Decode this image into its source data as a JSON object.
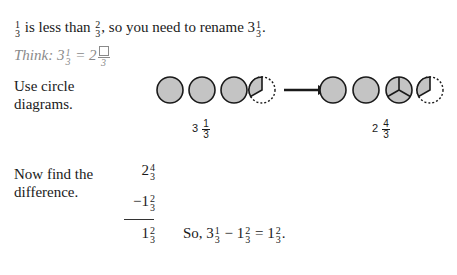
{
  "intro": {
    "lead_frac": {
      "num": "1",
      "den": "3"
    },
    "text_a": " is less than ",
    "mid_frac": {
      "num": "2",
      "den": "3"
    },
    "text_b": ", so you need to rename 3",
    "end_frac": {
      "num": "1",
      "den": "3"
    },
    "text_c": "."
  },
  "think": {
    "label": "Think: 3",
    "frac1": {
      "num": "1",
      "den": "3"
    },
    "eq": " = 2",
    "frac2": {
      "num": "□",
      "den": "3"
    }
  },
  "circles_section": {
    "instruction_line1": "Use circle",
    "instruction_line2": "diagrams.",
    "left_label": {
      "whole": "3",
      "num": "1",
      "den": "3"
    },
    "right_label": {
      "whole": "2",
      "num": "4",
      "den": "3"
    },
    "left_diagram": [
      "full-circle",
      "full-circle",
      "full-circle",
      "one-third-circle"
    ],
    "right_diagram": [
      "full-circle",
      "full-circle",
      "circle-split-thirds",
      "one-third-circle"
    ],
    "arrow": "right-arrow",
    "fill_color": "#c4c4c4",
    "stroke_color": "#1a1a1a"
  },
  "difference": {
    "instruction_line1": "Now find the",
    "instruction_line2": "difference.",
    "minuend": {
      "whole": "2",
      "num": "4",
      "den": "3"
    },
    "operator": "−",
    "subtrahend": {
      "whole": "1",
      "num": "2",
      "den": "3"
    },
    "result": {
      "whole": "1",
      "num": "2",
      "den": "3"
    },
    "conclusion": {
      "prefix": "So, 3",
      "f1": {
        "num": "1",
        "den": "3"
      },
      "minus": " − 1",
      "f2": {
        "num": "2",
        "den": "3"
      },
      "eq": " = 1",
      "f3": {
        "num": "2",
        "den": "3"
      },
      "end": "."
    }
  }
}
